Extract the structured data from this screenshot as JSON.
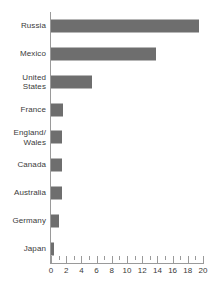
{
  "chart_data": {
    "type": "bar",
    "orientation": "horizontal",
    "title": "",
    "subtitle": "",
    "xlabel": "",
    "ylabel": "",
    "xlim": [
      0,
      20
    ],
    "grid": false,
    "legend": false,
    "bar_color": "#6e6e6e",
    "axis_color": "#9a9a9a",
    "text_color": "#3a3a3a",
    "categories": [
      "Russia",
      "Mexico",
      "United\nStates",
      "France",
      "England/\nWales",
      "Canada",
      "Australia",
      "Germany",
      "Japan"
    ],
    "values": [
      19.5,
      13.8,
      5.4,
      1.6,
      1.5,
      1.5,
      1.4,
      1.1,
      0.4
    ],
    "xticks": [
      0,
      2,
      4,
      6,
      8,
      10,
      12,
      14,
      16,
      18,
      20
    ],
    "xtick_labels": [
      "0",
      "2",
      "4",
      "6",
      "8",
      "10",
      "12",
      "14",
      "16",
      "18",
      "20"
    ],
    "minor_tick_step": 1
  }
}
